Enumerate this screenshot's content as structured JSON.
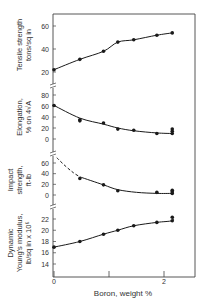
{
  "chart_data": [
    {
      "type": "line",
      "panel": "tensile",
      "ylabel": [
        "Tensile strength",
        "tons/sq in"
      ],
      "yticks": [
        20,
        40,
        60
      ],
      "ylim": [
        14,
        70
      ],
      "x": [
        0,
        0.47,
        0.9,
        1.16,
        1.45,
        1.87,
        2.15
      ],
      "values": [
        22,
        31,
        38,
        46,
        48,
        52,
        54
      ],
      "line_style": "solid"
    },
    {
      "type": "line",
      "panel": "elongation",
      "ylabel": [
        "Elongation,",
        "% on 4√A"
      ],
      "yticks": [
        0,
        20,
        40,
        60,
        80
      ],
      "ylim": [
        -8,
        84
      ],
      "x": [
        0,
        0.47,
        0.47,
        0.9,
        1.16,
        1.45,
        1.87,
        2.15,
        2.15,
        2.15
      ],
      "values": [
        61,
        35,
        33,
        29,
        18,
        16,
        10,
        10,
        14,
        18
      ],
      "curve": {
        "x": [
          0,
          0.47,
          0.9,
          1.16,
          1.45,
          1.87,
          2.15
        ],
        "y": [
          61,
          38,
          27,
          20,
          15,
          11,
          10
        ]
      },
      "line_style": "solid"
    },
    {
      "type": "line",
      "panel": "impact",
      "ylabel": [
        "Impact",
        "strength,",
        "ft-lb"
      ],
      "yticks": [
        0,
        20,
        40,
        60
      ],
      "ylim": [
        -6,
        70
      ],
      "x": [
        0.47,
        0.9,
        1.16,
        1.87,
        2.15,
        2.15,
        2.15
      ],
      "values": [
        31,
        19,
        8,
        5,
        3,
        6,
        9
      ],
      "curve_dashed": {
        "x": [
          0.05,
          0.2,
          0.35,
          0.47
        ],
        "y": [
          70,
          55,
          42,
          34
        ]
      },
      "curve_solid": {
        "x": [
          0.47,
          0.9,
          1.16,
          1.5,
          1.87,
          2.15
        ],
        "y": [
          34,
          19,
          10,
          5,
          3,
          3
        ]
      },
      "line_style": "dashed then solid"
    },
    {
      "type": "line",
      "panel": "youngs_modulus",
      "ylabel": [
        "Dynamic",
        "Young's modulus,",
        "lb/sq in x 10⁶"
      ],
      "yticks": [
        14,
        16,
        18,
        20,
        22
      ],
      "ylim": [
        12.5,
        23.5
      ],
      "x": [
        0,
        0.47,
        0.9,
        1.16,
        1.45,
        1.87,
        2.15,
        2.15
      ],
      "values": [
        17.0,
        18.0,
        19.3,
        20.0,
        20.8,
        21.4,
        21.7,
        22.3
      ],
      "line_style": "solid"
    }
  ],
  "x_axis": {
    "label": "Boron,   weight %",
    "ticks": [
      "0",
      "2"
    ],
    "xlim": [
      0,
      2.6
    ]
  },
  "colors": {
    "ink": "#1a1a1a",
    "axis": "#444444",
    "background": "#ffffff"
  }
}
